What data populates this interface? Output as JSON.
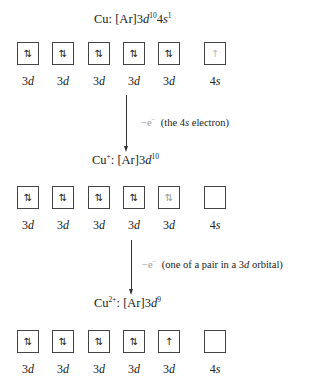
{
  "states": [
    {
      "id": "cu",
      "species": "Cu",
      "charge": "",
      "config_prefix": ": [Ar]3",
      "config_parts": [
        {
          "orbital": "d",
          "exponent": "10"
        },
        {
          "orbital_prefix": "4",
          "orbital": "s",
          "exponent": "1"
        }
      ],
      "orbitals": [
        {
          "label_num": "3",
          "label_sub": "d",
          "electrons": "⇅"
        },
        {
          "label_num": "3",
          "label_sub": "d",
          "electrons": "⇅"
        },
        {
          "label_num": "3",
          "label_sub": "d",
          "electrons": "⇅"
        },
        {
          "label_num": "3",
          "label_sub": "d",
          "electrons": "⇅"
        },
        {
          "label_num": "3",
          "label_sub": "d",
          "electrons": "⇅"
        },
        {
          "label_num": "4",
          "label_sub": "s",
          "electrons": "↑"
        }
      ]
    },
    {
      "id": "cu-plus",
      "species": "Cu",
      "charge": "+",
      "config_prefix": ": [Ar]3",
      "config_parts": [
        {
          "orbital": "d",
          "exponent": "10"
        }
      ],
      "orbitals": [
        {
          "label_num": "3",
          "label_sub": "d",
          "electrons": "⇅"
        },
        {
          "label_num": "3",
          "label_sub": "d",
          "electrons": "⇅"
        },
        {
          "label_num": "3",
          "label_sub": "d",
          "electrons": "⇅"
        },
        {
          "label_num": "3",
          "label_sub": "d",
          "electrons": "⇅"
        },
        {
          "label_num": "3",
          "label_sub": "d",
          "electrons": "⇅"
        },
        {
          "label_num": "4",
          "label_sub": "s",
          "electrons": ""
        }
      ]
    },
    {
      "id": "cu-2plus",
      "species": "Cu",
      "charge": "2+",
      "config_prefix": ": [Ar]3",
      "config_parts": [
        {
          "orbital": "d",
          "exponent": "9"
        }
      ],
      "orbitals": [
        {
          "label_num": "3",
          "label_sub": "d",
          "electrons": "⇅"
        },
        {
          "label_num": "3",
          "label_sub": "d",
          "electrons": "⇅"
        },
        {
          "label_num": "3",
          "label_sub": "d",
          "electrons": "⇅"
        },
        {
          "label_num": "3",
          "label_sub": "d",
          "electrons": "⇅"
        },
        {
          "label_num": "3",
          "label_sub": "d",
          "electrons": "↑"
        },
        {
          "label_num": "4",
          "label_sub": "s",
          "electrons": ""
        }
      ]
    }
  ],
  "transitions": [
    {
      "minus_label": "−e",
      "minus_sup": "−",
      "note_open": "(the 4",
      "note_italic": "s",
      "note_close": " electron)"
    },
    {
      "minus_label": "−e",
      "minus_sup": "−",
      "note_open": "(one of a pair in a 3",
      "note_italic": "d",
      "note_close": " orbital)"
    }
  ]
}
